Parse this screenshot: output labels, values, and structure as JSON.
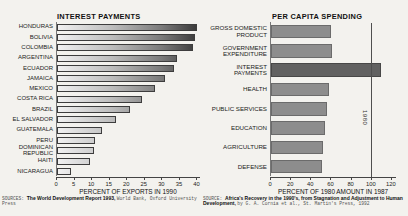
{
  "chart_data": [
    {
      "type": "bar",
      "orientation": "horizontal",
      "title": "INTEREST PAYMENTS",
      "xlabel": "PERCENT OF EXPORTS IN 1990",
      "categories": [
        "HONDURAS",
        "BOLIVIA",
        "COLOMBIA",
        "ARGENTINA",
        "ECUADOR",
        "JAMAICA",
        "MEXICO",
        "COSTA RICA",
        "BRAZIL",
        "EL SALVADOR",
        "GUATEMALA",
        "PERU",
        "DOMINICAN REPUBLIC",
        "HAITI",
        "NICARAGUA"
      ],
      "values": [
        40,
        39.5,
        39,
        34.5,
        33.5,
        31,
        28,
        24.5,
        21,
        17,
        13,
        11,
        10.5,
        9.5,
        4
      ],
      "xticks": [
        0,
        5,
        10,
        15,
        20,
        25,
        30,
        35,
        40
      ],
      "xlim": [
        0,
        41
      ],
      "grid": false,
      "bar_shading": "gradient-light-to-dark-by-scale"
    },
    {
      "type": "bar",
      "orientation": "horizontal",
      "title": "PER CAPITA SPENDING",
      "xlabel": "PERCENT OF 1980 AMOUNT IN 1987",
      "categories": [
        "GROSS DOMESTIC PRODUCT",
        "GOVERNMENT EXPENDITURE",
        "INTEREST PAYMENTS",
        "HEALTH",
        "PUBLIC SERVICES",
        "EDUCATION",
        "AGRICULTURE",
        "DEFENSE"
      ],
      "values": [
        60,
        61,
        110,
        58,
        56,
        54,
        52,
        51
      ],
      "xticks": [
        0,
        20,
        40,
        60,
        80,
        100,
        120
      ],
      "xlim": [
        0,
        125
      ],
      "grid": false,
      "highlight_index": 2,
      "highlight_color": "#616161",
      "bar_color": "#8d8d8d",
      "reference_line": {
        "value": 100,
        "label": "1980"
      }
    }
  ],
  "sources": [
    {
      "parts": [
        {
          "text": "SOURCES: ",
          "style": "label"
        },
        {
          "text": "The World Development Report 1993, ",
          "style": "title"
        },
        {
          "text": "World Bank, Oxford University Press",
          "style": "plain"
        }
      ]
    },
    {
      "parts": [
        {
          "text": "SOURCE: ",
          "style": "label"
        },
        {
          "text": "Africa's Recovery in the 1990's, from Stagnation and Adjustment to Human Development, ",
          "style": "title"
        },
        {
          "text": "by G. A. Cornia et al., St. Martin's Press, 1992",
          "style": "plain"
        }
      ]
    }
  ]
}
